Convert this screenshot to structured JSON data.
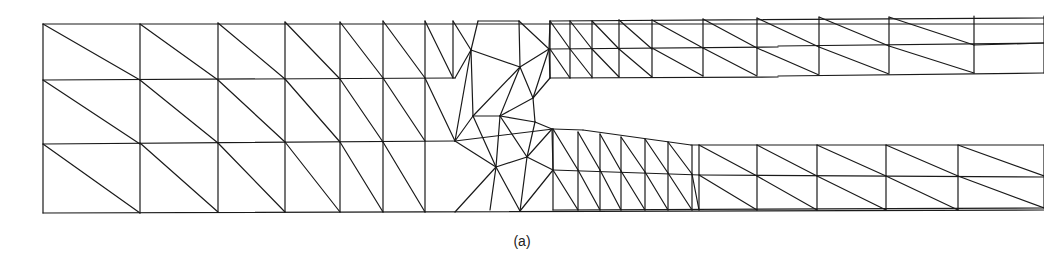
{
  "figure": {
    "caption": "(a)",
    "stroke_color": "#1a1a1a",
    "background": "#ffffff"
  },
  "mesh": {
    "segments": [
      [
        43,
        24,
        1044,
        24
      ],
      [
        43,
        24,
        43,
        213
      ],
      [
        43,
        80,
        455,
        78
      ],
      [
        43,
        144,
        455,
        141
      ],
      [
        43,
        213,
        1044,
        210
      ],
      [
        140,
        24,
        140,
        213
      ],
      [
        218,
        23,
        218,
        212
      ],
      [
        285,
        22,
        285,
        212
      ],
      [
        340,
        22,
        340,
        212
      ],
      [
        383,
        21,
        383,
        212
      ],
      [
        425,
        21,
        425,
        212
      ],
      [
        453,
        21,
        453,
        78
      ],
      [
        43,
        24,
        140,
        80
      ],
      [
        140,
        24,
        218,
        80
      ],
      [
        218,
        23,
        285,
        79
      ],
      [
        285,
        22,
        340,
        79
      ],
      [
        340,
        22,
        383,
        78
      ],
      [
        383,
        21,
        425,
        78
      ],
      [
        425,
        21,
        453,
        78
      ],
      [
        43,
        80,
        140,
        144
      ],
      [
        140,
        80,
        218,
        143
      ],
      [
        218,
        80,
        285,
        142
      ],
      [
        285,
        79,
        340,
        142
      ],
      [
        340,
        79,
        383,
        142
      ],
      [
        383,
        78,
        425,
        141
      ],
      [
        425,
        78,
        455,
        141
      ],
      [
        43,
        144,
        140,
        213
      ],
      [
        140,
        143,
        218,
        212
      ],
      [
        218,
        143,
        285,
        212
      ],
      [
        285,
        142,
        340,
        212
      ],
      [
        340,
        142,
        383,
        212
      ],
      [
        383,
        142,
        425,
        212
      ],
      [
        455,
        78,
        471,
        50
      ],
      [
        453,
        21,
        471,
        50
      ],
      [
        471,
        50,
        478,
        21
      ],
      [
        471,
        50,
        520,
        67
      ],
      [
        520,
        67,
        519,
        21
      ],
      [
        478,
        21,
        519,
        21
      ],
      [
        520,
        67,
        549,
        49
      ],
      [
        519,
        21,
        549,
        49
      ],
      [
        549,
        49,
        550,
        21
      ],
      [
        471,
        50,
        455,
        141
      ],
      [
        471,
        50,
        473,
        116
      ],
      [
        520,
        67,
        473,
        116
      ],
      [
        520,
        67,
        500,
        116
      ],
      [
        473,
        116,
        500,
        116
      ],
      [
        520,
        67,
        533,
        98
      ],
      [
        549,
        49,
        533,
        98
      ],
      [
        549,
        49,
        550,
        78
      ],
      [
        533,
        98,
        550,
        78
      ],
      [
        500,
        116,
        533,
        98
      ],
      [
        500,
        116,
        535,
        122
      ],
      [
        533,
        98,
        535,
        122
      ],
      [
        455,
        141,
        473,
        116
      ],
      [
        455,
        141,
        496,
        167
      ],
      [
        473,
        116,
        496,
        167
      ],
      [
        500,
        116,
        496,
        167
      ],
      [
        500,
        116,
        527,
        157
      ],
      [
        535,
        122,
        527,
        157
      ],
      [
        496,
        167,
        527,
        157
      ],
      [
        535,
        122,
        552,
        129
      ],
      [
        552,
        129,
        527,
        157
      ],
      [
        496,
        167,
        490,
        210
      ],
      [
        496,
        167,
        455,
        212
      ],
      [
        496,
        167,
        520,
        211
      ],
      [
        527,
        157,
        520,
        211
      ],
      [
        527,
        157,
        553,
        170
      ],
      [
        552,
        129,
        553,
        170
      ],
      [
        553,
        170,
        520,
        211
      ],
      [
        550,
        21,
        1044,
        18
      ],
      [
        550,
        49,
        778,
        47
      ],
      [
        778,
        46,
        1044,
        43
      ],
      [
        550,
        78,
        778,
        77
      ],
      [
        778,
        76,
        1044,
        73
      ],
      [
        550,
        21,
        550,
        78
      ],
      [
        570,
        21,
        570,
        78
      ],
      [
        592,
        21,
        592,
        78
      ],
      [
        619,
        20,
        619,
        77
      ],
      [
        652,
        20,
        652,
        77
      ],
      [
        703,
        19,
        703,
        76
      ],
      [
        757,
        18,
        757,
        75
      ],
      [
        819,
        17,
        819,
        74
      ],
      [
        889,
        17,
        889,
        73
      ],
      [
        974,
        16,
        974,
        73
      ],
      [
        1044,
        16,
        1044,
        73
      ],
      [
        550,
        21,
        570,
        49
      ],
      [
        570,
        21,
        592,
        49
      ],
      [
        592,
        21,
        619,
        49
      ],
      [
        619,
        20,
        652,
        49
      ],
      [
        652,
        20,
        703,
        48
      ],
      [
        703,
        19,
        757,
        48
      ],
      [
        757,
        18,
        819,
        47
      ],
      [
        819,
        17,
        889,
        46
      ],
      [
        889,
        17,
        974,
        45
      ],
      [
        550,
        49,
        570,
        78
      ],
      [
        570,
        49,
        592,
        77
      ],
      [
        592,
        49,
        619,
        77
      ],
      [
        619,
        49,
        652,
        77
      ],
      [
        652,
        48,
        703,
        76
      ],
      [
        703,
        48,
        757,
        76
      ],
      [
        757,
        48,
        819,
        75
      ],
      [
        819,
        47,
        889,
        74
      ],
      [
        889,
        46,
        974,
        73
      ],
      [
        974,
        45,
        1044,
        43
      ],
      [
        455,
        141,
        553,
        129
      ],
      [
        553,
        129,
        583,
        130
      ],
      [
        583,
        130,
        691,
        145
      ],
      [
        691,
        145,
        1044,
        145
      ],
      [
        553,
        170,
        700,
        175
      ],
      [
        700,
        175,
        1044,
        177
      ],
      [
        553,
        210,
        1044,
        208
      ],
      [
        553,
        129,
        553,
        210
      ],
      [
        578,
        132,
        578,
        210
      ],
      [
        600,
        134,
        600,
        210
      ],
      [
        621,
        137,
        621,
        210
      ],
      [
        645,
        139,
        645,
        210
      ],
      [
        668,
        142,
        668,
        210
      ],
      [
        692,
        145,
        692,
        210
      ],
      [
        699,
        145,
        699,
        210
      ],
      [
        757,
        145,
        757,
        210
      ],
      [
        817,
        145,
        817,
        210
      ],
      [
        886,
        145,
        886,
        210
      ],
      [
        958,
        145,
        958,
        210
      ],
      [
        1044,
        145,
        1044,
        208
      ],
      [
        553,
        129,
        578,
        170
      ],
      [
        578,
        132,
        600,
        170
      ],
      [
        600,
        134,
        621,
        171
      ],
      [
        621,
        137,
        645,
        172
      ],
      [
        645,
        139,
        668,
        173
      ],
      [
        668,
        142,
        692,
        174
      ],
      [
        699,
        145,
        757,
        176
      ],
      [
        757,
        145,
        817,
        176
      ],
      [
        817,
        145,
        886,
        176
      ],
      [
        886,
        145,
        958,
        176
      ],
      [
        958,
        145,
        1044,
        176
      ],
      [
        553,
        170,
        578,
        210
      ],
      [
        578,
        170,
        600,
        210
      ],
      [
        600,
        170,
        621,
        210
      ],
      [
        621,
        171,
        645,
        210
      ],
      [
        645,
        172,
        668,
        210
      ],
      [
        668,
        173,
        692,
        210
      ],
      [
        692,
        174,
        699,
        210
      ],
      [
        699,
        175,
        757,
        210
      ],
      [
        757,
        176,
        817,
        210
      ],
      [
        817,
        176,
        886,
        210
      ],
      [
        886,
        176,
        958,
        210
      ],
      [
        958,
        176,
        1044,
        208
      ]
    ]
  }
}
